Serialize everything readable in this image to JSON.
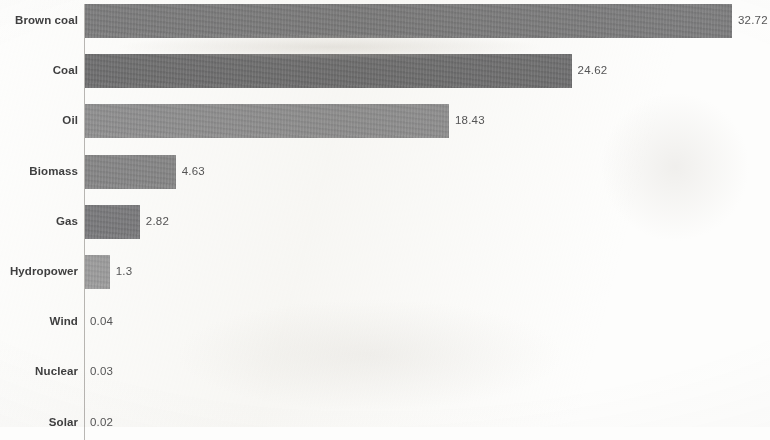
{
  "chart_data": {
    "type": "bar",
    "orientation": "horizontal",
    "title": "",
    "subtitle": "",
    "xlabel": "",
    "ylabel": "",
    "grid": false,
    "legend": false,
    "xlim": [
      0,
      32.72
    ],
    "categories": [
      "Brown coal",
      "Coal",
      "Oil",
      "Biomass",
      "Gas",
      "Hydropower",
      "Wind",
      "Nuclear",
      "Solar"
    ],
    "values": [
      32.72,
      24.62,
      18.43,
      4.63,
      2.82,
      1.3,
      0.04,
      0.03,
      0.02
    ],
    "value_labels": [
      "32.72",
      "24.62",
      "18.43",
      "4.63",
      "2.82",
      "1.3",
      "0.04",
      "0.03",
      "0.02"
    ],
    "bar_colors": [
      "#79797a",
      "#6c6c6d",
      "#8d8d8e",
      "#848485",
      "#77777a",
      "#9b9b9c",
      "#ffffff",
      "#ffffff",
      "#ffffff"
    ]
  },
  "style": {
    "background": "#fdfdfc",
    "axis_color": "#b9b7b4",
    "category_label_color": "#3f3f40",
    "value_label_color": "#555556"
  }
}
